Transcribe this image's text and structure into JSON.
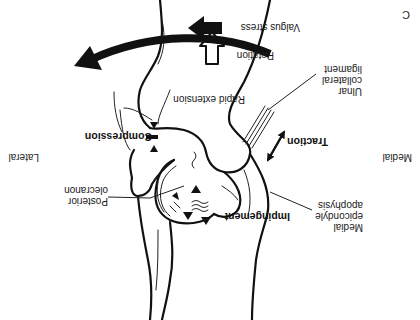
{
  "figure": {
    "panel_letter": "C",
    "orientation_note_rotation_deg": 180,
    "side_labels": {
      "left": "Medial",
      "right": "Lateral"
    },
    "force_labels": {
      "valgus_stress": "Valgus stress",
      "rotation": "Rotation",
      "rapid_extension": "Rapid extension",
      "traction": "Traction",
      "compression": "Compression",
      "impingement": "Impingement"
    },
    "anatomy_labels": {
      "ulnar_collateral_ligament": [
        "Ulnar",
        "collateral",
        "ligament"
      ],
      "posterior_olecranon": [
        "Posterior",
        "olecranon"
      ],
      "medial_epicondyle_apophysis": [
        "Medial",
        "epicondyle",
        "apophysis"
      ]
    },
    "colors": {
      "ink": "#111111",
      "background": "#ffffff"
    }
  }
}
